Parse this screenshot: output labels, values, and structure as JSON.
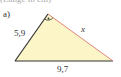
{
  "header": {
    "cropped_text": "(Länge in cm)"
  },
  "figure": {
    "part_label": "a)",
    "side_left": "5,9",
    "side_base": "9,7",
    "side_hypotenuse": "x",
    "colors": {
      "fill": "#fbf5c8",
      "leg_stroke": "#333333",
      "hypotenuse_stroke": "#e0877a"
    }
  }
}
